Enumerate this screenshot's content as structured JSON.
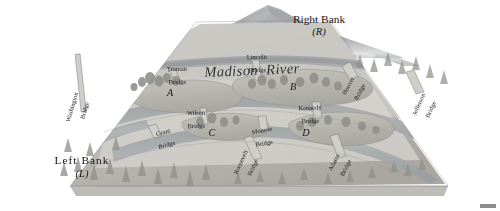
{
  "figure": {
    "kind": "perspective-relief-map",
    "river_label": "Madison  River",
    "palette": {
      "sky": "#ffffff",
      "mountain_far": "#a9acae",
      "mountain_near": "#9a9ea0",
      "water": "#a8acad",
      "water_dark": "#8d9294",
      "land_light": "#d3d2cd",
      "land_mid": "#c3c2bc",
      "land_shadow": "#a6a49e",
      "island": "#bdbcb5",
      "bridge": "#cfcec8",
      "tree": "#8e9089",
      "text": "#15161a",
      "edge": "#7e8082",
      "corner_mark": "#8d8d8d"
    }
  },
  "banks": [
    {
      "id": "right",
      "name": "Right Bank",
      "symbol": "(R)"
    },
    {
      "id": "left",
      "name": "Left Bank",
      "symbol": "(L)"
    }
  ],
  "islands": [
    {
      "id": "A",
      "label": "A"
    },
    {
      "id": "B",
      "label": "B"
    },
    {
      "id": "C",
      "label": "C"
    },
    {
      "id": "D",
      "label": "D"
    }
  ],
  "bridges": [
    {
      "id": "washington",
      "line1": "Washington",
      "line2": "Bridge"
    },
    {
      "id": "truman",
      "line1": "Truman",
      "line2": "Bridge"
    },
    {
      "id": "lincoln",
      "line1": "Lincoln",
      "line2": "Bridge"
    },
    {
      "id": "hoover",
      "line1": "Hoover",
      "line2": "Bridge"
    },
    {
      "id": "jefferson",
      "line1": "Jefferson",
      "line2": "Bridge"
    },
    {
      "id": "wilson",
      "line1": "Wilson",
      "line2": "Bridge"
    },
    {
      "id": "kennedy",
      "line1": "Kennedy",
      "line2": "Bridge"
    },
    {
      "id": "grant",
      "line1": "Grant",
      "line2": "Bridge"
    },
    {
      "id": "monroe",
      "line1": "Monroe",
      "line2": "Bridge"
    },
    {
      "id": "roosevelt",
      "line1": "Roosevelt",
      "line2": "Bridge"
    },
    {
      "id": "adams",
      "line1": "Adams",
      "line2": "Bridge"
    }
  ]
}
